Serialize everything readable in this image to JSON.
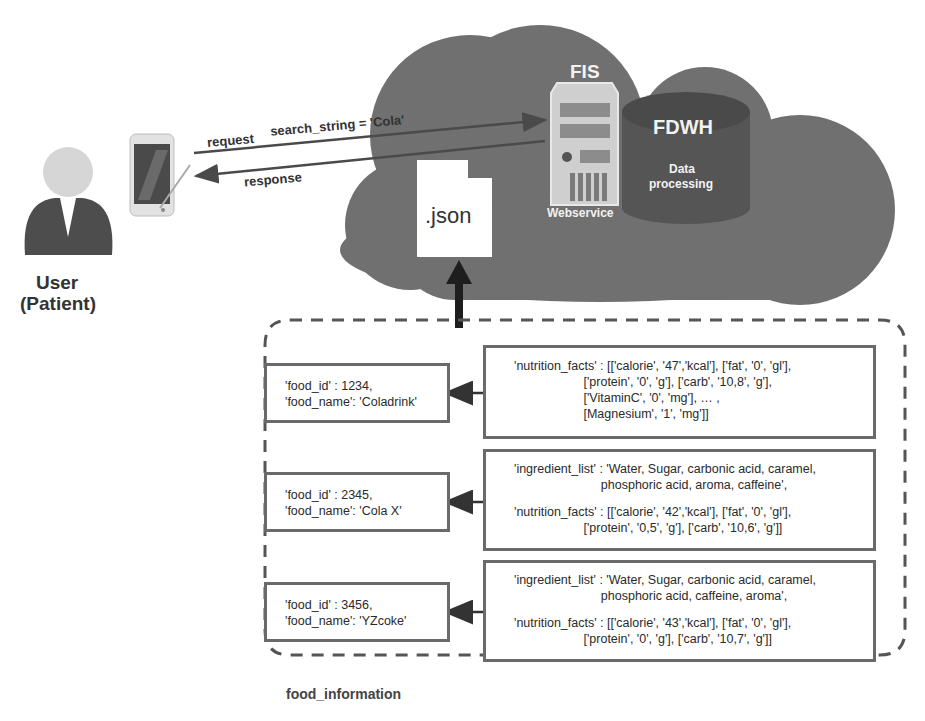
{
  "user": {
    "label_line1": "User",
    "label_line2": "(Patient)"
  },
  "communication": {
    "request_label": "request",
    "search_label": "search_string = 'Cola'",
    "response_label": "response"
  },
  "cloud": {
    "json_file_label": ".json",
    "server_title": "FIS",
    "server_caption": "Webservice",
    "database_title": "FDWH",
    "database_caption_line1": "Data",
    "database_caption_line2": "processing"
  },
  "food_information": {
    "group_label": "food_information",
    "records": [
      {
        "id_line": "'food_id' : 1234,",
        "name_line": "'food_name': 'Coladrink'",
        "details": [
          "'nutrition_facts' : [['calorie', '47','kcal'], ['fat', '0', 'gl'],",
          "                    ['protein', '0', 'g'], ['carb', '10,8', 'g'],",
          "                    ['VitaminC', '0', 'mg'], … ,",
          "                    [Magnesium', '1', 'mg']]"
        ]
      },
      {
        "id_line": "'food_id' : 2345,",
        "name_line": "'food_name': 'Cola X'",
        "details": [
          "'ingredient_list' : 'Water, Sugar, carbonic acid, caramel,",
          "                         phosphoric acid, aroma, caffeine',",
          "",
          "'nutrition_facts' : [['calorie', '42','kcal'], ['fat', '0', 'gl'],",
          "                    ['protein', '0,5', 'g'], ['carb', '10,6', 'g']]"
        ]
      },
      {
        "id_line": "'food_id' : 3456,",
        "name_line": "'food_name': 'YZcoke'",
        "details": [
          "'ingredient_list' : 'Water, Sugar, carbonic acid, caramel,",
          "                         phosphoric acid, caffeine, aroma',",
          "",
          "'nutrition_facts' : [['calorie', '43','kcal'], ['fat', '0', 'gl'],",
          "                    ['protein', '0', 'g'], ['carb', '10,7', 'g']]"
        ]
      }
    ]
  },
  "colors": {
    "cloud": "#6e6e6e",
    "database": "#555555",
    "server": "#c9c9c9",
    "box_border": "#6a6a6a",
    "dashed_border": "#555555"
  }
}
